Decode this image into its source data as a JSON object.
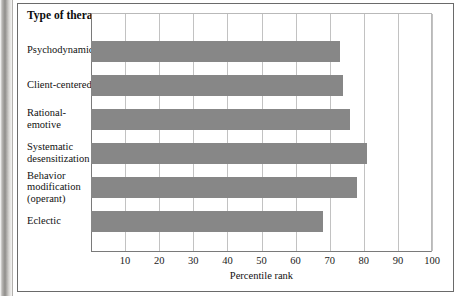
{
  "figure": {
    "category_header": "Type of\ntherapy",
    "bar_color": "#878787",
    "grid_color": "#c2c2c2",
    "axis_color": "#7a7a7a"
  },
  "chart_data": {
    "type": "bar",
    "orientation": "horizontal",
    "title": "",
    "xlabel": "Percentile rank",
    "ylabel": "Type of therapy",
    "categories": [
      "Psychodynamic",
      "Client-centered",
      "Rational-\nemotive",
      "Systematic\ndesensitization",
      "Behavior\nmodification\n(operant)",
      "Eclectic"
    ],
    "values": [
      73,
      74,
      76,
      81,
      78,
      68
    ],
    "xlim": [
      0,
      100
    ],
    "xticks": [
      10,
      20,
      30,
      40,
      50,
      60,
      70,
      80,
      90,
      100
    ],
    "xticklabels": [
      "10",
      "20",
      "30",
      "40",
      "50",
      "60",
      "70",
      "80",
      "90",
      "100"
    ],
    "grid": "vertical",
    "legend": null
  }
}
